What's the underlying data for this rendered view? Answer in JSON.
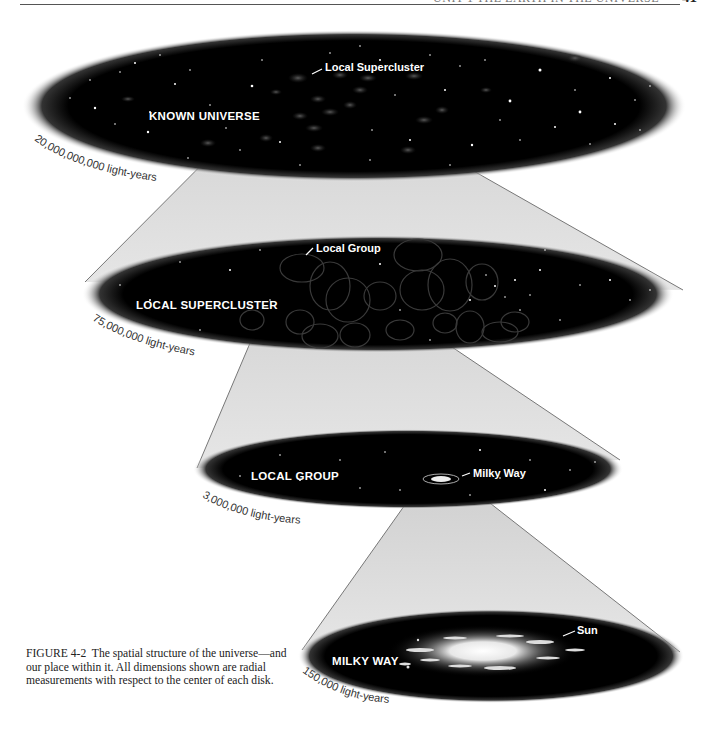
{
  "header": {
    "running_head": "UNIT 1  THE EARTH IN THE UNIVERSE",
    "page_number": "41"
  },
  "figure": {
    "disks": [
      {
        "id": "known-universe",
        "label": "KNOWN UNIVERSE",
        "dimension": "20,000,000,000 light-years",
        "callout": "Local Supercluster"
      },
      {
        "id": "local-supercluster",
        "label": "LOCAL SUPERCLUSTER",
        "dimension": "75,000,000 light-years",
        "callout": "Local Group"
      },
      {
        "id": "local-group",
        "label": "LOCAL GROUP",
        "dimension": "3,000,000 light-years",
        "callout": "Milky Way"
      },
      {
        "id": "milky-way",
        "label": "MILKY WAY",
        "dimension": "150,000 light-years",
        "callout": "Sun"
      }
    ],
    "colors": {
      "disk": "#000000",
      "cone": "#d8d8d8",
      "cone_line": "#777777",
      "label": "#ffffff"
    }
  },
  "caption": {
    "figure_number": "FIGURE 4-2",
    "text": "The spatial structure of the universe—and our place within it. All dimensions shown are radial measurements with respect to the center of each disk."
  }
}
